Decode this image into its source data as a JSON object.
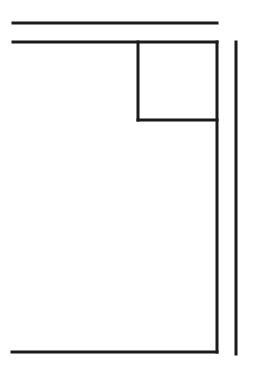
{
  "diagram": {
    "type": "line-drawing",
    "stroke_color": "#1a1a1a",
    "background": "#ffffff",
    "stroke_width": 3,
    "lines": [
      {
        "name": "top-horizontal-line",
        "x1": 13,
        "y1": 23,
        "x2": 217,
        "y2": 23
      },
      {
        "name": "second-horizontal-line",
        "x1": 13,
        "y1": 42,
        "x2": 217,
        "y2": 42
      },
      {
        "name": "inner-box-left-edge",
        "x1": 138,
        "y1": 42,
        "x2": 138,
        "y2": 120
      },
      {
        "name": "inner-box-bottom-edge",
        "x1": 138,
        "y1": 120,
        "x2": 217,
        "y2": 120
      },
      {
        "name": "frame-right-edge",
        "x1": 217,
        "y1": 42,
        "x2": 217,
        "y2": 352
      },
      {
        "name": "bottom-horizontal-line",
        "x1": 12,
        "y1": 352,
        "x2": 217,
        "y2": 352
      },
      {
        "name": "outer-right-vertical-line",
        "x1": 236,
        "y1": 42,
        "x2": 236,
        "y2": 354
      }
    ]
  }
}
